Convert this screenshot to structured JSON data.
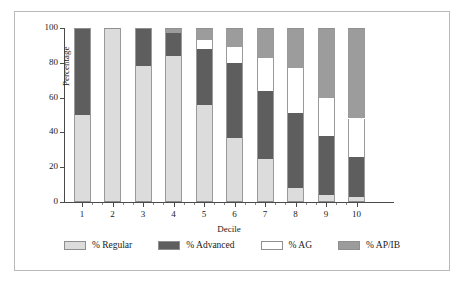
{
  "chart_data": {
    "type": "bar",
    "stacked": true,
    "title": "",
    "xlabel": "Decile",
    "ylabel": "Percentage",
    "ylim": [
      0,
      100
    ],
    "yticks": [
      0,
      20,
      40,
      60,
      80,
      100
    ],
    "grid": false,
    "legend_position": "bottom",
    "categories": [
      "1",
      "2",
      "3",
      "4",
      "5",
      "6",
      "7",
      "8",
      "9",
      "10"
    ],
    "series": [
      {
        "name": "% Regular",
        "color": "#dcdcdc",
        "values": [
          50,
          100,
          78,
          84,
          56,
          37,
          25,
          8,
          4,
          3
        ]
      },
      {
        "name": "% Advanced",
        "color": "#5e5e5e",
        "values": [
          50,
          0,
          22,
          13,
          32,
          43,
          39,
          43,
          34,
          23
        ]
      },
      {
        "name": "% AG",
        "color": "#ffffff",
        "values": [
          0,
          0,
          0,
          0,
          5,
          9,
          19,
          26,
          22,
          22
        ]
      },
      {
        "name": "% AP/IB",
        "color": "#9c9c9c",
        "values": [
          0,
          0,
          0,
          3,
          7,
          11,
          17,
          23,
          40,
          52
        ]
      }
    ]
  },
  "legend": {
    "items": [
      {
        "label": "% Regular",
        "key": "regular"
      },
      {
        "label": "% Advanced",
        "key": "advanced"
      },
      {
        "label": "% AG",
        "key": "ag"
      },
      {
        "label": "% AP/IB",
        "key": "apib"
      }
    ]
  }
}
